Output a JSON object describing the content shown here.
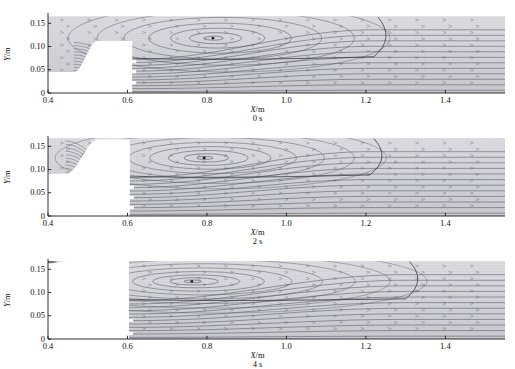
{
  "figure": {
    "axis_color": "#1a1a1a",
    "streamline_color": "#4a4a52",
    "fill_light": "#e9e9ec",
    "fill_mid": "#d6d6da",
    "fill_dark": "#6f6f75"
  },
  "axes": {
    "x_label": "X/m",
    "x_label_var": "X",
    "x_label_unit": "/m",
    "y_label": "Y/m",
    "y_label_var": "Y",
    "y_label_unit": "/m",
    "x_ticks": [
      "0.4",
      "0.6",
      "0.8",
      "1.0",
      "1.2",
      "1.4"
    ],
    "x_tick_values": [
      0.4,
      0.6,
      0.8,
      1.0,
      1.2,
      1.4
    ],
    "y_ticks": [
      "0",
      "0.05",
      "0.10",
      "0.15"
    ],
    "y_tick_values": [
      0,
      0.05,
      0.1,
      0.15
    ],
    "xlim": [
      0.4,
      1.55
    ],
    "ylim": [
      0,
      0.17
    ]
  },
  "panels": [
    {
      "caption": "0 s",
      "time_s": 0,
      "vortex_center": {
        "x": 0.815,
        "y": 0.118
      },
      "vortex_rings": 7,
      "step_x": 0.612,
      "inlet_top_y": 0.045,
      "ramp_start_x": 0.465,
      "ramp_end_x": 0.525,
      "plateau_y": 0.112,
      "downstream_top_y": 0.165,
      "separation_reattach_x": 1.22,
      "shear_layer_start_y": 0.075,
      "dash_marks_y": [
        0.068,
        0.046,
        0.022
      ],
      "dark_band_y": [
        0.0,
        0.032
      ]
    },
    {
      "caption": "2 s",
      "time_s": 2,
      "vortex_center": {
        "x": 0.793,
        "y": 0.125
      },
      "vortex_rings": 8,
      "step_x": 0.606,
      "inlet_top_y": 0.091,
      "ramp_start_x": 0.445,
      "ramp_end_x": 0.527,
      "plateau_y": 0.165,
      "downstream_top_y": 0.168,
      "separation_reattach_x": 1.21,
      "shear_layer_start_y": 0.086,
      "dash_marks_y": [
        0.062,
        0.04,
        0.018
      ],
      "dark_band_y": []
    },
    {
      "caption": "4 s",
      "time_s": 4,
      "vortex_center": {
        "x": 0.762,
        "y": 0.124
      },
      "vortex_rings": 9,
      "step_x": 0.604,
      "inlet_top_y": 0.163,
      "ramp_start_x": 0.4,
      "ramp_end_x": 0.455,
      "plateau_y": 0.168,
      "downstream_top_y": 0.168,
      "separation_reattach_x": 1.3,
      "shear_layer_start_y": 0.086,
      "dash_marks_y": [
        0.04,
        0.012
      ],
      "dark_band_y": []
    }
  ],
  "chart_data": {
    "type": "line",
    "title": "",
    "subtitle": "",
    "xlabel": "X/m",
    "ylabel": "Y/m",
    "xlim": [
      0.4,
      1.55
    ],
    "ylim": [
      0,
      0.17
    ],
    "grid": false,
    "legend": "none",
    "annotations": [
      "0 s",
      "2 s",
      "4 s"
    ],
    "series": [
      {
        "name": "0 s",
        "vortex_center_x": 0.815,
        "vortex_center_y": 0.118,
        "step_x": 0.612,
        "reattachment_x": 1.22,
        "free_surface_y": 0.165
      },
      {
        "name": "2 s",
        "vortex_center_x": 0.793,
        "vortex_center_y": 0.125,
        "step_x": 0.606,
        "reattachment_x": 1.21,
        "free_surface_y": 0.168
      },
      {
        "name": "4 s",
        "vortex_center_x": 0.762,
        "vortex_center_y": 0.124,
        "step_x": 0.604,
        "reattachment_x": 1.3,
        "free_surface_y": 0.168
      }
    ]
  }
}
